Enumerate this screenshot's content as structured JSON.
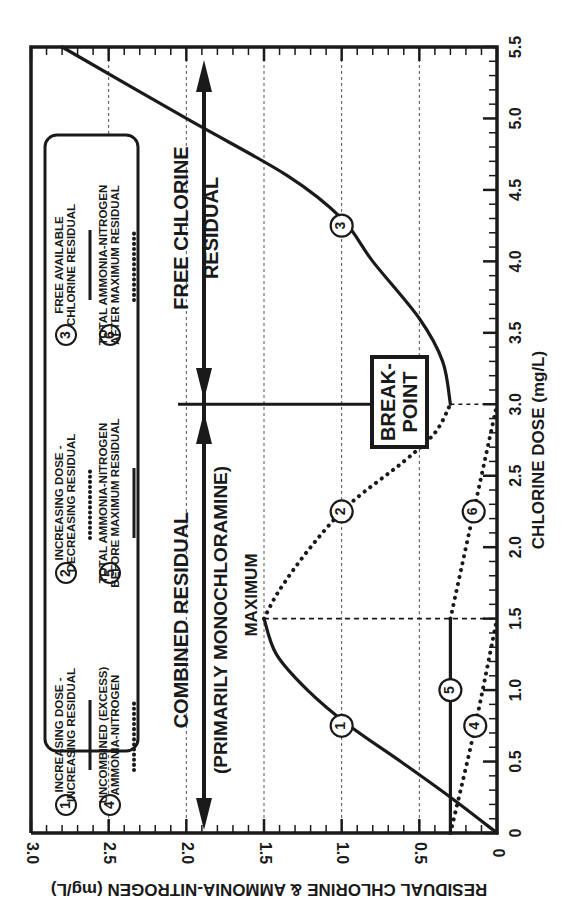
{
  "chart_data": {
    "type": "line",
    "orientation": "rotated-90-ccw",
    "title": "",
    "xlabel": "CHLORINE DOSE (mg/L)",
    "ylabel": "RESIDUAL CHLORINE & AMMONIA-NITROGEN (mg/L)",
    "xlim": [
      0,
      5.5
    ],
    "ylim": [
      0,
      3.0
    ],
    "xticks": [
      "0",
      "0.5",
      "1.0",
      "1.5",
      "2.0",
      "2.5",
      "3.0",
      "3.5",
      "4.0",
      "4.5",
      "5.0",
      "5.5"
    ],
    "yticks": [
      "0",
      "0.5",
      "1.0",
      "1.5",
      "2.0",
      "2.5",
      "3.0"
    ],
    "grid": true,
    "series": [
      {
        "id": 1,
        "name": "INCREASING DOSE - INCREASING RESIDUAL",
        "style": "solid",
        "x": [
          0,
          0.25,
          0.5,
          0.75,
          1.0,
          1.25,
          1.5
        ],
        "y": [
          0,
          0.3,
          0.62,
          0.95,
          1.22,
          1.42,
          1.5
        ]
      },
      {
        "id": 2,
        "name": "INCREASING DOSE - DECREASING RESIDUAL",
        "style": "dashed",
        "x": [
          1.5,
          1.7,
          2.0,
          2.3,
          2.6,
          2.8,
          3.0
        ],
        "y": [
          1.5,
          1.4,
          1.2,
          0.95,
          0.6,
          0.4,
          0.3
        ]
      },
      {
        "id": 3,
        "name": "FREE AVAILABLE CHLORINE RESIDUAL",
        "style": "solid",
        "x": [
          3.0,
          3.3,
          3.6,
          4.0,
          4.3,
          4.6,
          5.0,
          5.5
        ],
        "y": [
          0.3,
          0.35,
          0.5,
          0.8,
          1.0,
          1.35,
          2.0,
          2.8
        ]
      },
      {
        "id": 4,
        "name": "UNCOMBINED (EXCESS) AMMONIA-NITROGEN",
        "style": "dashed",
        "x": [
          0,
          0.7,
          1.5
        ],
        "y": [
          0.3,
          0.15,
          0
        ]
      },
      {
        "id": 5,
        "name": "TOTAL AMMONIA-NITROGEN BEFORE MAXIMUM RESIDUAL",
        "style": "solid",
        "x": [
          0,
          1.5
        ],
        "y": [
          0.3,
          0.3
        ]
      },
      {
        "id": 6,
        "name": "TOTAL AMMONIA-NITROGEN AFTER MAXIMUM RESIDUAL",
        "style": "dashed",
        "x": [
          1.5,
          2.25,
          3.0
        ],
        "y": [
          0.3,
          0.15,
          0
        ]
      }
    ],
    "markers": [
      {
        "label": "1",
        "x": 0.75,
        "y": 1.0
      },
      {
        "label": "2",
        "x": 2.25,
        "y": 1.0
      },
      {
        "label": "3",
        "x": 4.25,
        "y": 1.0
      },
      {
        "label": "4",
        "x": 0.75,
        "y": 0.14
      },
      {
        "label": "5",
        "x": 1.0,
        "y": 0.3
      },
      {
        "label": "6",
        "x": 2.25,
        "y": 0.15
      }
    ],
    "annotations": [
      {
        "text": "MAXIMUM",
        "x": 1.5,
        "y": 1.5
      },
      {
        "text": "BREAK-POINT",
        "x": 3.0,
        "y": 0.3
      },
      {
        "text": "COMBINED RESIDUAL",
        "region": [
          0,
          3.0
        ]
      },
      {
        "text": "(PRIMARILY MONOCHLORAMINE)",
        "region": [
          0,
          3.0
        ]
      },
      {
        "text": "FREE CHLORINE RESIDUAL",
        "region": [
          3.0,
          5.5
        ]
      }
    ],
    "legend": {
      "position": "inside-top-left",
      "entries": [
        {
          "num": "1",
          "lines": [
            "INCREASING DOSE -",
            "INCREASING RESIDUAL"
          ],
          "style": "solid"
        },
        {
          "num": "2",
          "lines": [
            "INCREASING DOSE -",
            "DECREASING RESIDUAL"
          ],
          "style": "dashed"
        },
        {
          "num": "3",
          "lines": [
            "FREE AVAILABLE",
            "CHLORINE RESIDUAL"
          ],
          "style": "solid"
        },
        {
          "num": "4",
          "lines": [
            "UNCOMBINED (EXCESS)",
            "AMMONIA-NITROGEN"
          ],
          "style": "dashed"
        },
        {
          "num": "5",
          "lines": [
            "TOTAL AMMONIA-NITROGEN",
            "BEFORE MAXIMUM RESIDUAL"
          ],
          "style": "solid"
        },
        {
          "num": "6",
          "lines": [
            "TOTAL AMMONIA-NITROGEN",
            "AFTER MAXIMUM RESIDUAL"
          ],
          "style": "dashed"
        }
      ]
    }
  },
  "labels": {
    "combined_residual": "COMBINED RESIDUAL",
    "primarily_monochloramine": "(PRIMARILY MONOCHLORAMINE)",
    "free_chlorine": "FREE CHLORINE",
    "residual": "RESIDUAL",
    "maximum": "MAXIMUM",
    "break": "BREAK-",
    "point": "POINT"
  },
  "colors": {
    "ink": "#1a1a1a",
    "grid": "#555555",
    "background": "#ffffff"
  }
}
